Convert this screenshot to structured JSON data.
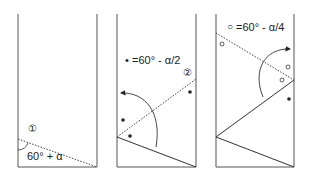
{
  "panels": [
    {
      "step": "①",
      "angle_label": "60° + α"
    },
    {
      "step": "②",
      "legend_symbol": "•",
      "legend_label": "=60° - α/2"
    },
    {
      "legend_symbol": "○",
      "legend_label": "=60° - α/4"
    }
  ],
  "colors": {
    "line": "#333333",
    "frame": "#555555",
    "background": "#ffffff"
  }
}
